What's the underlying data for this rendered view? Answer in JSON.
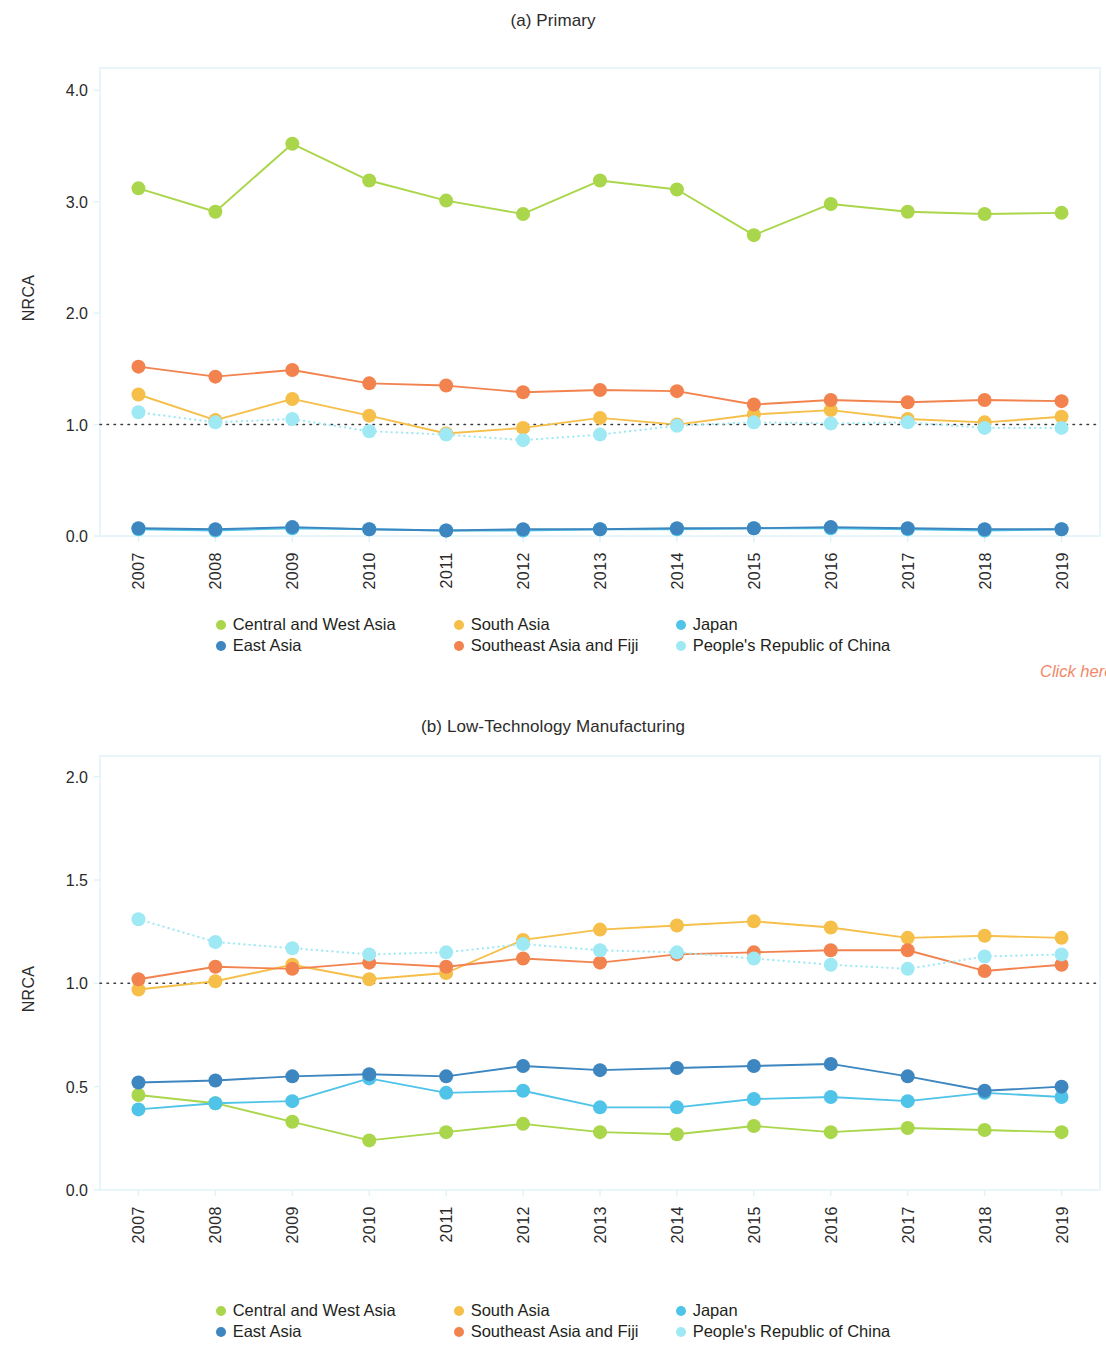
{
  "figures": [
    {
      "id": "a",
      "title": "(a) Primary",
      "ylabel": "NRCA"
    },
    {
      "id": "b",
      "title": "(b) Low-Technology Manufacturing",
      "ylabel": "NRCA"
    }
  ],
  "annotation": {
    "click_here": "Click here"
  },
  "legend": {
    "entries": [
      {
        "label": "Central and West Asia",
        "color": "#a9d64a"
      },
      {
        "label": "South Asia",
        "color": "#f5bf49"
      },
      {
        "label": "Japan",
        "color": "#4fc4e8"
      },
      {
        "label": "East Asia",
        "color": "#3d86bf"
      },
      {
        "label": "Southeast Asia and Fiji",
        "color": "#f2834f"
      },
      {
        "label": "People's Republic of China",
        "color": "#9fe9f5"
      }
    ]
  },
  "chart_data": [
    {
      "type": "line",
      "title": "(a) Primary",
      "xlabel": "",
      "ylabel": "NRCA",
      "ylim": [
        0.0,
        4.2
      ],
      "yticks": [
        "0.0",
        "1.0",
        "2.0",
        "3.0",
        "4.0"
      ],
      "ytickvalues": [
        0.0,
        1.0,
        2.0,
        3.0,
        4.0
      ],
      "grid": false,
      "reference_line": 1.0,
      "legend_position": "bottom",
      "x": [
        "2007",
        "2008",
        "2009",
        "2010",
        "2011",
        "2012",
        "2013",
        "2014",
        "2015",
        "2016",
        "2017",
        "2018",
        "2019"
      ],
      "series": [
        {
          "name": "Central and West Asia",
          "color": "#a9d64a",
          "style": "solid",
          "values": [
            3.12,
            2.91,
            3.52,
            3.19,
            3.01,
            2.89,
            3.19,
            3.11,
            2.7,
            2.98,
            2.91,
            2.89,
            2.9
          ]
        },
        {
          "name": "South Asia",
          "color": "#f5bf49",
          "style": "solid",
          "values": [
            1.27,
            1.04,
            1.23,
            1.08,
            0.92,
            0.97,
            1.06,
            1.0,
            1.09,
            1.13,
            1.05,
            1.02,
            1.07
          ]
        },
        {
          "name": "Japan",
          "color": "#4fc4e8",
          "style": "solid",
          "values": [
            0.06,
            0.05,
            0.07,
            0.06,
            0.05,
            0.05,
            0.06,
            0.06,
            0.07,
            0.07,
            0.06,
            0.05,
            0.06
          ]
        },
        {
          "name": "East Asia",
          "color": "#3d86bf",
          "style": "solid",
          "values": [
            0.07,
            0.06,
            0.08,
            0.06,
            0.05,
            0.06,
            0.06,
            0.07,
            0.07,
            0.08,
            0.07,
            0.06,
            0.06
          ]
        },
        {
          "name": "Southeast Asia and Fiji",
          "color": "#f2834f",
          "style": "solid",
          "values": [
            1.52,
            1.43,
            1.49,
            1.37,
            1.35,
            1.29,
            1.31,
            1.3,
            1.18,
            1.22,
            1.2,
            1.22,
            1.21
          ]
        },
        {
          "name": "People's Republic of China",
          "color": "#9fe9f5",
          "style": "dotted",
          "values": [
            1.11,
            1.02,
            1.05,
            0.94,
            0.91,
            0.86,
            0.91,
            0.99,
            1.02,
            1.01,
            1.02,
            0.97,
            0.97
          ]
        }
      ]
    },
    {
      "type": "line",
      "title": "(b) Low-Technology Manufacturing",
      "xlabel": "",
      "ylabel": "NRCA",
      "ylim": [
        0.0,
        2.1
      ],
      "yticks": [
        "0.0",
        "0.5",
        "1.0",
        "1.5",
        "2.0"
      ],
      "ytickvalues": [
        0.0,
        0.5,
        1.0,
        1.5,
        2.0
      ],
      "grid": false,
      "reference_line": 1.0,
      "legend_position": "bottom",
      "x": [
        "2007",
        "2008",
        "2009",
        "2010",
        "2011",
        "2012",
        "2013",
        "2014",
        "2015",
        "2016",
        "2017",
        "2018",
        "2019"
      ],
      "series": [
        {
          "name": "Central and West Asia",
          "color": "#a9d64a",
          "style": "solid",
          "values": [
            0.46,
            0.42,
            0.33,
            0.24,
            0.28,
            0.32,
            0.28,
            0.27,
            0.31,
            0.28,
            0.3,
            0.29,
            0.28
          ]
        },
        {
          "name": "South Asia",
          "color": "#f5bf49",
          "style": "solid",
          "values": [
            0.97,
            1.01,
            1.09,
            1.02,
            1.05,
            1.21,
            1.26,
            1.28,
            1.3,
            1.27,
            1.22,
            1.23,
            1.22
          ]
        },
        {
          "name": "Japan",
          "color": "#4fc4e8",
          "style": "solid",
          "values": [
            0.39,
            0.42,
            0.43,
            0.54,
            0.47,
            0.48,
            0.4,
            0.4,
            0.44,
            0.45,
            0.43,
            0.47,
            0.45
          ]
        },
        {
          "name": "East Asia",
          "color": "#3d86bf",
          "style": "solid",
          "values": [
            0.52,
            0.53,
            0.55,
            0.56,
            0.55,
            0.6,
            0.58,
            0.59,
            0.6,
            0.61,
            0.55,
            0.48,
            0.5
          ]
        },
        {
          "name": "Southeast Asia and Fiji",
          "color": "#f2834f",
          "style": "solid",
          "values": [
            1.02,
            1.08,
            1.07,
            1.1,
            1.08,
            1.12,
            1.1,
            1.14,
            1.15,
            1.16,
            1.16,
            1.06,
            1.09
          ]
        },
        {
          "name": "People's Republic of China",
          "color": "#9fe9f5",
          "style": "dotted",
          "values": [
            1.31,
            1.2,
            1.17,
            1.14,
            1.15,
            1.19,
            1.16,
            1.15,
            1.12,
            1.09,
            1.07,
            1.13,
            1.14
          ]
        }
      ]
    }
  ]
}
